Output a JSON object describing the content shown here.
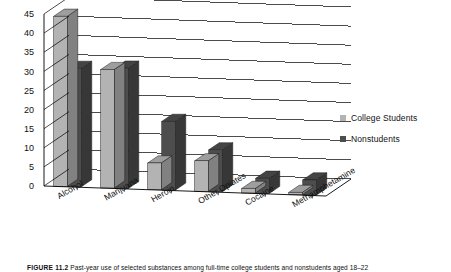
{
  "figure": {
    "caption_number": "FIGURE 11.2",
    "caption_text": "Past-year use of selected substances among full-time college students and nonstudents aged 18–22"
  },
  "legend": {
    "position": "right",
    "items": [
      {
        "label": "College Students",
        "color": "#b3b3b3",
        "name": "college-students"
      },
      {
        "label": "Nonstudents",
        "color": "#4d4d4d",
        "name": "nonstudents"
      }
    ]
  },
  "axis": {
    "y_ticks": [
      "0",
      "5",
      "10",
      "15",
      "20",
      "25",
      "30",
      "35",
      "40",
      "45"
    ],
    "x_labels": [
      "Alcohol",
      "Marijuana",
      "Heroin",
      "Other Opiates",
      "Cocaine",
      "Methamphetamine"
    ]
  },
  "chart_data": {
    "type": "bar",
    "title": "",
    "subtitle": "",
    "xlabel": "",
    "ylabel": "",
    "ylim": [
      0,
      45
    ],
    "ytick_step": 5,
    "grid": true,
    "legend_position": "right",
    "three_d": true,
    "categories": [
      "Alcohol",
      "Marijuana",
      "Heroin",
      "Other Opiates",
      "Cocaine",
      "Methamphetamine"
    ],
    "series": [
      {
        "name": "College Students",
        "color": "#b3b3b3",
        "values": [
          44.5,
          31,
          7,
          8,
          1.2,
          0.6
        ]
      },
      {
        "name": "Nonstudents",
        "color": "#4d4d4d",
        "values": [
          31,
          31.5,
          18,
          11,
          4,
          4
        ]
      }
    ]
  }
}
